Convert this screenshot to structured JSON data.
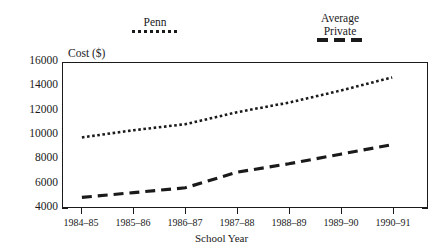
{
  "chart_data": {
    "type": "line",
    "title": "",
    "xlabel": "School Year",
    "ylabel": "Cost ($)",
    "categories": [
      "1984–85",
      "1985–86",
      "1986–87",
      "1987–88",
      "1988–89",
      "1989–90",
      "1990–91"
    ],
    "ylim": [
      4000,
      16000
    ],
    "ytick_labels": [
      "16000",
      "14000",
      "12000",
      "10000",
      "8000",
      "6000",
      "4000"
    ],
    "ytick_values": [
      16000,
      14000,
      12000,
      10000,
      8000,
      6000,
      4000
    ],
    "yminor_step": 1000,
    "grid": false,
    "legend_position": "above-plot",
    "series": [
      {
        "name": "Penn",
        "legend_label": "Penn",
        "style": "dotted",
        "color": "#1a1a1a",
        "values": [
          9800,
          10400,
          10900,
          11900,
          12700,
          13700,
          14800
        ]
      },
      {
        "name": "Average Private",
        "legend_label": "Average\nPrivate",
        "style": "dashed",
        "color": "#1a1a1a",
        "values": [
          4800,
          5200,
          5600,
          6900,
          7600,
          8400,
          9200
        ]
      }
    ]
  }
}
